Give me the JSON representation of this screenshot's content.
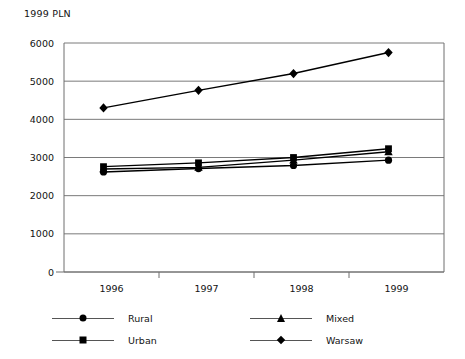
{
  "chart_data": {
    "type": "line",
    "title": "1999 PLN",
    "xlabel": "",
    "ylabel": "",
    "categories": [
      "1996",
      "1997",
      "1998",
      "1999"
    ],
    "ylim": [
      0,
      6000
    ],
    "ytick_labels": [
      "0",
      "1000",
      "2000",
      "3000",
      "4000",
      "5000",
      "6000"
    ],
    "ytick_values": [
      0,
      1000,
      2000,
      3000,
      4000,
      5000,
      6000
    ],
    "grid": true,
    "legend_position": "bottom",
    "series": [
      {
        "name": "Rural",
        "marker": "circle",
        "values": [
          2620,
          2710,
          2790,
          2930
        ]
      },
      {
        "name": "Urban",
        "marker": "square",
        "values": [
          2760,
          2860,
          3000,
          3230
        ]
      },
      {
        "name": "Mixed",
        "marker": "triangle",
        "values": [
          2700,
          2740,
          2930,
          3150
        ]
      },
      {
        "name": "Warsaw",
        "marker": "diamond",
        "values": [
          4300,
          4760,
          5200,
          5750
        ]
      }
    ]
  },
  "legend": {
    "items": [
      {
        "label": "Rural",
        "marker": "circle"
      },
      {
        "label": "Mixed",
        "marker": "triangle"
      },
      {
        "label": "Urban",
        "marker": "square"
      },
      {
        "label": "Warsaw",
        "marker": "diamond"
      }
    ]
  },
  "colors": {
    "series": "#000000",
    "grid": "#7a7a7a",
    "axis": "#6e6e6e",
    "text": "#121212",
    "background": "#ffffff"
  }
}
